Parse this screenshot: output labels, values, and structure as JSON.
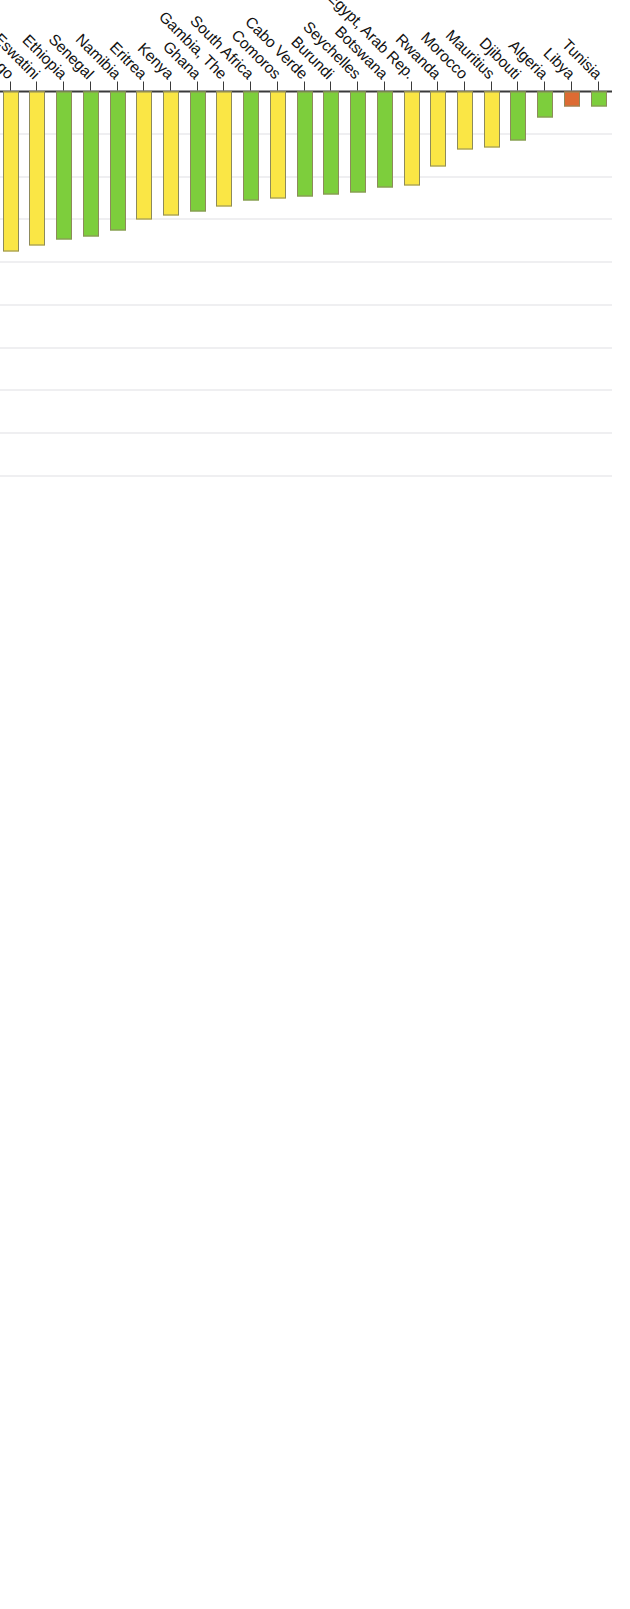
{
  "chart_data": {
    "type": "bar",
    "orientation": "horizontal",
    "title": "",
    "xlabel": "",
    "ylabel": "Number of births per 1,000 women ages 15-19",
    "ylim": [
      0,
      180
    ],
    "ytick_labels": [
      "0",
      "20",
      "40",
      "60",
      "80",
      "100",
      "120",
      "140",
      "160",
      "180"
    ],
    "ytick_values": [
      0,
      20,
      40,
      60,
      80,
      100,
      120,
      140,
      160,
      180
    ],
    "grid": true,
    "legend": "none",
    "colors": {
      "yellow": "#FAE645",
      "green": "#7DCE3C",
      "orange": "#DD6B33",
      "black": "#000000",
      "bar_stroke": "#8d8a5c",
      "axis": "#3a3a3a",
      "grid": "#dfdfe4",
      "text": "#111111"
    },
    "categories": [
      "Niger",
      "Mozambique",
      "Mali",
      "Central African Republic",
      "Equatorial Guinea",
      "Angola",
      "Chad",
      "Tanzania",
      "Liberia",
      "Madagascar",
      "Somalia",
      "Malawi",
      "Zambia",
      "Guinea",
      "Burkina Faso",
      "Cameroon",
      "Congo, Dem. Rep.",
      "Uganda",
      "Cote d'Ivoire",
      "Congo, Rep.",
      "Nigeria",
      "Sierra Leone",
      "Sub-Saharan Africa",
      "South Sudan",
      "Zimbabwe",
      "Benin",
      "Gabon",
      "Lesotho",
      "Guinea-Bissau",
      "Sudan",
      "Sao Tome and Principe",
      "Mauritania",
      "Togo",
      "Eswatini",
      "Ethiopia",
      "Senegal",
      "Namibia",
      "Eritrea",
      "Kenya",
      "Ghana",
      "Gambia, The",
      "South Africa",
      "Comoros",
      "Cabo Verde",
      "Burundi",
      "Seychelles",
      "Botswana",
      "Egypt, Arab Rep.",
      "Rwanda",
      "Morocco",
      "Mauritius",
      "Djibouti",
      "Algeria",
      "Libya",
      "Tunisia"
    ],
    "values": [
      170,
      164,
      160,
      158,
      150,
      139,
      138,
      137,
      123,
      122,
      120,
      119,
      117,
      115,
      113,
      111,
      110,
      110,
      108,
      107,
      104,
      103,
      100,
      97,
      97,
      91,
      89,
      87,
      84,
      80,
      79,
      76,
      75,
      72,
      69,
      68,
      65,
      60,
      58,
      56,
      54,
      51,
      50,
      49,
      48,
      47,
      45,
      44,
      35,
      27,
      26,
      23,
      12,
      7,
      7
    ],
    "series_colors": [
      "yellow",
      "yellow",
      "orange",
      "yellow",
      "yellow",
      "yellow",
      "yellow",
      "yellow",
      "yellow",
      "yellow",
      "yellow",
      "yellow",
      "yellow",
      "yellow",
      "yellow",
      "yellow",
      "yellow",
      "green",
      "yellow",
      "yellow",
      "yellow",
      "green",
      "black",
      "green",
      "green",
      "yellow",
      "yellow",
      "yellow",
      "orange",
      "yellow",
      "yellow",
      "green",
      "yellow",
      "yellow",
      "green",
      "green",
      "green",
      "yellow",
      "yellow",
      "green",
      "yellow",
      "green",
      "yellow",
      "green",
      "green",
      "green",
      "green",
      "yellow",
      "yellow",
      "yellow",
      "yellow",
      "green",
      "green",
      "orange",
      "green",
      "yellow"
    ]
  },
  "axis": {
    "title": "Number of births per 1,000 women ages 15-19"
  }
}
